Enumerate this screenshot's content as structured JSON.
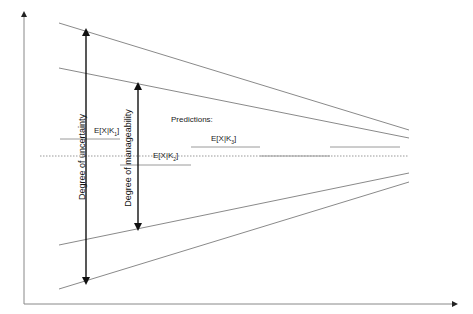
{
  "diagram": {
    "type": "uncertainty-funnel",
    "colors": {
      "axis": "#888888",
      "funnel_line": "#8a8a8a",
      "arrow": "#111111",
      "prediction_line": "#9a9a9a",
      "dotted_center": "#999999"
    },
    "axes": {
      "y_axis": {
        "x": 24,
        "y_top": 14,
        "y_bottom": 304,
        "label": ""
      },
      "x_axis": {
        "y": 304,
        "x_left": 24,
        "x_right": 455,
        "label": ""
      }
    },
    "funnel_lines": [
      {
        "name": "outer-upper-bound",
        "x1": 59,
        "y1": 23,
        "x2": 409,
        "y2": 130
      },
      {
        "name": "inner-upper-bound",
        "x1": 59,
        "y1": 68,
        "x2": 409,
        "y2": 138
      },
      {
        "name": "inner-lower-bound",
        "x1": 59,
        "y1": 245,
        "x2": 409,
        "y2": 173
      },
      {
        "name": "outer-lower-bound",
        "x1": 59,
        "y1": 289,
        "x2": 409,
        "y2": 182
      }
    ],
    "center_line": {
      "style": "dotted",
      "y": 156,
      "x1": 40,
      "x2": 409
    },
    "arrows": [
      {
        "name": "uncertainty-arrow",
        "label": "Degree of uncertainty",
        "x": 86,
        "y_top": 32,
        "y_bottom": 281
      },
      {
        "name": "manageability-arrow",
        "label": "Degree of manageability",
        "x": 138,
        "y_top": 86,
        "y_bottom": 227
      }
    ],
    "predictions_title": "Predictions:",
    "predictions": [
      {
        "id": "K1",
        "label_prefix": "E[X|K",
        "subscript": "1",
        "label_suffix": "]",
        "line": {
          "x1": 60,
          "x2": 120,
          "y": 139
        }
      },
      {
        "id": "K2",
        "label_prefix": "E[X|K",
        "subscript": "2",
        "label_suffix": "]",
        "line": {
          "x1": 120,
          "x2": 191,
          "y": 165
        }
      },
      {
        "id": "K3",
        "label_prefix": "E[X|K",
        "subscript": "3",
        "label_suffix": "]",
        "line": {
          "x1": 191,
          "x2": 260,
          "y": 147
        }
      },
      {
        "id": "K4",
        "label_prefix": "",
        "subscript": "",
        "label_suffix": "",
        "line": {
          "x1": 260,
          "x2": 330,
          "y": 156
        }
      },
      {
        "id": "K5",
        "label_prefix": "",
        "subscript": "",
        "label_suffix": "",
        "line": {
          "x1": 330,
          "x2": 400,
          "y": 147
        }
      }
    ]
  }
}
